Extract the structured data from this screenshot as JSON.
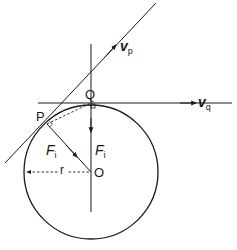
{
  "diagram": {
    "type": "physics-circular-motion",
    "colors": {
      "stroke": "#1a1a1a",
      "background": "#ffffff"
    },
    "points": {
      "P": {
        "label": "P"
      },
      "Q": {
        "label": "Q"
      },
      "O": {
        "label": "O"
      }
    },
    "vectors": {
      "vp": {
        "symbol": "v",
        "subscript": "p"
      },
      "vq": {
        "symbol": "v",
        "subscript": "q"
      },
      "Fi_p": {
        "symbol": "F",
        "subscript": "i"
      },
      "Fi_q": {
        "symbol": "F",
        "subscript": "i"
      }
    },
    "radius": {
      "label": "r"
    }
  }
}
